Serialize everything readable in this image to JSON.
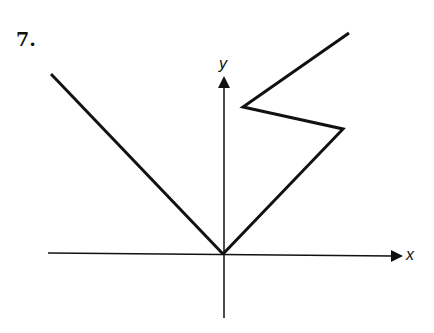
{
  "problem_number": "7.",
  "axes": {
    "x_label": "x",
    "y_label": "y"
  },
  "graph": {
    "description": "Relation graph: line from upper-left through origin, then zigzag path in first quadrant",
    "left_ray": {
      "from": [
        51,
        74
      ],
      "to": [
        223,
        254
      ]
    },
    "right_path": [
      [
        223,
        254
      ],
      [
        343,
        129
      ],
      [
        243,
        107
      ],
      [
        349,
        33
      ]
    ]
  },
  "colors": {
    "stroke": "#111111",
    "background": "#ffffff"
  }
}
